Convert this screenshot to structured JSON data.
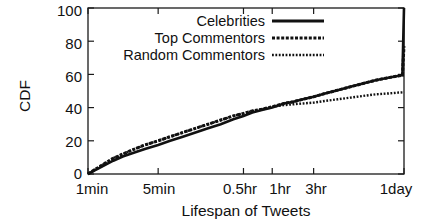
{
  "chart_data": {
    "type": "line",
    "title": "",
    "xlabel": "Lifespan of Tweets",
    "ylabel": "CDF",
    "ylim": [
      0,
      100
    ],
    "yticks": [
      0,
      20,
      40,
      60,
      80,
      100
    ],
    "ytick_labels": [
      "0",
      "20",
      "40",
      "60",
      "80",
      "100"
    ],
    "xtick_labels": [
      "1min",
      "5min",
      "0.5hr",
      "1hr",
      "3hr",
      "1day"
    ],
    "xtick_positions": [
      0,
      0.222,
      0.492,
      0.583,
      0.714,
      1.0
    ],
    "x_scale": "log",
    "grid": false,
    "legend_position": "top-right",
    "legend": [
      "Celebrities",
      "Top Commentors",
      "Random Commentors"
    ],
    "series": [
      {
        "name": "Celebrities",
        "style": "solid",
        "points": [
          [
            0.0,
            0
          ],
          [
            0.02,
            2
          ],
          [
            0.05,
            5
          ],
          [
            0.08,
            8
          ],
          [
            0.11,
            10.5
          ],
          [
            0.14,
            12.5
          ],
          [
            0.18,
            15
          ],
          [
            0.222,
            17.5
          ],
          [
            0.26,
            20
          ],
          [
            0.3,
            22.5
          ],
          [
            0.34,
            25
          ],
          [
            0.38,
            27.5
          ],
          [
            0.42,
            30
          ],
          [
            0.46,
            33
          ],
          [
            0.492,
            35
          ],
          [
            0.52,
            37
          ],
          [
            0.55,
            38.5
          ],
          [
            0.583,
            40
          ],
          [
            0.62,
            42.5
          ],
          [
            0.65,
            43.5
          ],
          [
            0.68,
            45
          ],
          [
            0.714,
            46.5
          ],
          [
            0.75,
            48.5
          ],
          [
            0.79,
            50.5
          ],
          [
            0.83,
            52.5
          ],
          [
            0.87,
            54.5
          ],
          [
            0.91,
            56.5
          ],
          [
            0.95,
            58
          ],
          [
            0.98,
            59
          ],
          [
            0.995,
            59.5
          ],
          [
            1.0,
            100
          ]
        ]
      },
      {
        "name": "Top Commentors",
        "style": "dashed",
        "points": [
          [
            0.0,
            0
          ],
          [
            0.02,
            2.5
          ],
          [
            0.05,
            6
          ],
          [
            0.08,
            9.5
          ],
          [
            0.11,
            12
          ],
          [
            0.14,
            14.5
          ],
          [
            0.18,
            17.5
          ],
          [
            0.222,
            20
          ],
          [
            0.26,
            22.5
          ],
          [
            0.3,
            25
          ],
          [
            0.34,
            27.5
          ],
          [
            0.38,
            30
          ],
          [
            0.42,
            32.5
          ],
          [
            0.46,
            35
          ],
          [
            0.492,
            36.5
          ],
          [
            0.52,
            38
          ],
          [
            0.55,
            39
          ],
          [
            0.583,
            40.5
          ],
          [
            0.62,
            42.5
          ],
          [
            0.65,
            43.5
          ],
          [
            0.68,
            45
          ],
          [
            0.714,
            46.5
          ],
          [
            0.75,
            48.5
          ],
          [
            0.79,
            50.5
          ],
          [
            0.83,
            52.5
          ],
          [
            0.87,
            54.5
          ],
          [
            0.91,
            56.5
          ],
          [
            0.95,
            58
          ],
          [
            0.98,
            59
          ],
          [
            0.995,
            59.5
          ],
          [
            1.0,
            77
          ]
        ]
      },
      {
        "name": "Random Commentors",
        "style": "dotted",
        "points": [
          [
            0.0,
            0
          ],
          [
            0.02,
            2.5
          ],
          [
            0.05,
            6
          ],
          [
            0.08,
            9.5
          ],
          [
            0.11,
            12
          ],
          [
            0.14,
            14.5
          ],
          [
            0.18,
            17.5
          ],
          [
            0.222,
            20
          ],
          [
            0.26,
            22.5
          ],
          [
            0.3,
            25
          ],
          [
            0.34,
            27.5
          ],
          [
            0.38,
            30
          ],
          [
            0.42,
            32.5
          ],
          [
            0.46,
            35
          ],
          [
            0.492,
            36.5
          ],
          [
            0.52,
            38
          ],
          [
            0.55,
            39
          ],
          [
            0.583,
            40.5
          ],
          [
            0.62,
            41.5
          ],
          [
            0.65,
            42
          ],
          [
            0.68,
            42.5
          ],
          [
            0.714,
            43
          ],
          [
            0.75,
            44
          ],
          [
            0.79,
            45
          ],
          [
            0.83,
            46
          ],
          [
            0.87,
            47
          ],
          [
            0.91,
            48
          ],
          [
            0.95,
            48.5
          ],
          [
            0.98,
            49
          ],
          [
            0.995,
            49.2
          ],
          [
            1.0,
            49.5
          ]
        ]
      }
    ]
  },
  "axes": {
    "y_title": "CDF",
    "x_title": "Lifespan of Tweets",
    "y_labels": [
      "100",
      "80",
      "60",
      "40",
      "20",
      "0"
    ],
    "x_labels": [
      "1min",
      "5min",
      "0.5hr",
      "1hr",
      "3hr",
      "1day"
    ]
  },
  "legend": {
    "items": [
      {
        "label": "Celebrities",
        "swatch": "solid-line-swatch"
      },
      {
        "label": "Top Commentors",
        "swatch": "dashed-line-swatch"
      },
      {
        "label": "Random Commentors",
        "swatch": "dotted-line-swatch"
      }
    ]
  }
}
